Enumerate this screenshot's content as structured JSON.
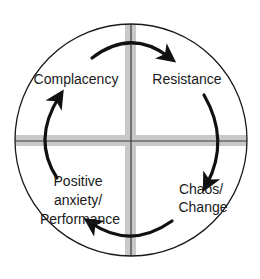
{
  "diagram": {
    "type": "cycle",
    "colors": {
      "background": "#ffffff",
      "circle_stroke": "#1a1a1a",
      "cross_band": "#c8c8c8",
      "cross_line": "#3a3a3a",
      "arrow": "#111111",
      "text": "#1a1a1a"
    },
    "stages": [
      {
        "id": "complacency",
        "quadrant": "top-left",
        "lines": [
          "Complacency"
        ]
      },
      {
        "id": "resistance",
        "quadrant": "top-right",
        "lines": [
          "Resistance"
        ]
      },
      {
        "id": "chaos",
        "quadrant": "bottom-right",
        "lines": [
          "Chaos/",
          "Change"
        ]
      },
      {
        "id": "positive",
        "quadrant": "bottom-left",
        "lines": [
          "Positive",
          "anxiety/",
          "Performance"
        ]
      }
    ],
    "flow": [
      "Complacency",
      "Resistance",
      "Chaos/Change",
      "Positive anxiety/Performance",
      "Complacency"
    ],
    "direction": "clockwise"
  }
}
